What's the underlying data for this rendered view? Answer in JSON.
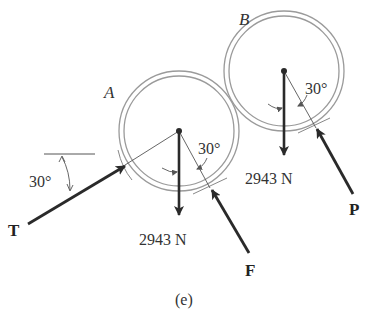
{
  "figure": {
    "caption": "(e)",
    "colors": {
      "ring": "#9a9a9a",
      "force": "#2a2a2a",
      "thin": "#555555",
      "text": "#333333"
    }
  },
  "cylinder_a": {
    "label": "A",
    "weight_label": "2943 N",
    "contact_angle_label": "30°"
  },
  "cylinder_b": {
    "label": "B",
    "weight_label": "2943 N",
    "contact_angle_label": "30°"
  },
  "forces": {
    "t": {
      "label": "T",
      "angle_label": "30°"
    },
    "f": {
      "label": "F"
    },
    "p": {
      "label": "P"
    }
  }
}
